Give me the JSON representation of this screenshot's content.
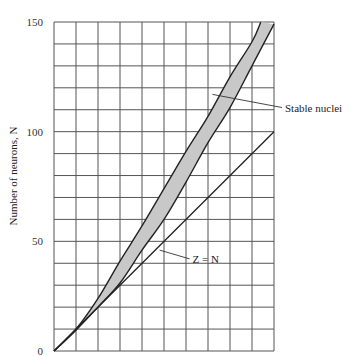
{
  "chart_data": {
    "type": "area",
    "title": "",
    "xlabel": "",
    "ylabel": "Number of neurons, N",
    "xlim": [
      0,
      100
    ],
    "ylim": [
      0,
      150
    ],
    "grid": true,
    "x_grid_step": 10,
    "y_grid_step": 10,
    "yticks": [
      0,
      50,
      100,
      150
    ],
    "ytick_labels": [
      "0",
      "50",
      "100",
      "150"
    ],
    "band": {
      "name": "Stable nuclei",
      "fill": "#c8c8c8",
      "upper": {
        "x": [
          0,
          10,
          20,
          30,
          40,
          50,
          60,
          70,
          80,
          90,
          94
        ],
        "y": [
          0,
          10,
          24,
          41,
          57,
          74,
          91,
          107,
          125,
          141,
          150
        ]
      },
      "lower": {
        "x": [
          0,
          10,
          20,
          30,
          40,
          50,
          60,
          70,
          80,
          90,
          100
        ],
        "y": [
          0,
          9.5,
          20,
          31,
          46,
          60,
          77,
          95,
          111,
          130,
          149
        ]
      }
    },
    "series": [
      {
        "name": "Z = N",
        "x": [
          0,
          100
        ],
        "y": [
          0,
          100
        ]
      }
    ],
    "annotations": [
      {
        "text": "Stable nuclei",
        "points_to": [
          72,
          117
        ],
        "label_at": [
          105,
          111
        ]
      },
      {
        "text": "Z = N",
        "points_to": [
          48,
          46
        ],
        "label_at": [
          63,
          42
        ]
      }
    ]
  }
}
